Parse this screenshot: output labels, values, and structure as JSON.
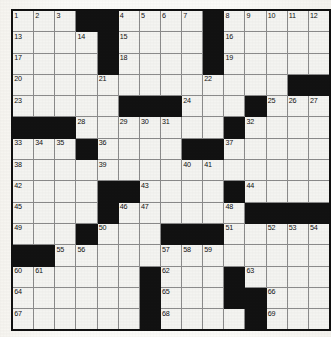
{
  "puzzle": {
    "type": "crossword-grid",
    "rows": 14,
    "cols": 15,
    "colors": {
      "block": "#121212",
      "cell": "#f4f4f1",
      "border": "#8b8b8b",
      "outer_border": "#111111",
      "number_text": "#101010",
      "page_background": "#fbfbf8"
    },
    "legend": {
      "W": "white answer cell",
      "B": "black blocked cell"
    },
    "layout": [
      [
        "W",
        "W",
        "W",
        "B",
        "B",
        "W",
        "W",
        "W",
        "W",
        "B",
        "W",
        "W",
        "W",
        "W",
        "W"
      ],
      [
        "W",
        "W",
        "W",
        "W",
        "B",
        "W",
        "W",
        "W",
        "W",
        "B",
        "W",
        "W",
        "W",
        "W",
        "W"
      ],
      [
        "W",
        "W",
        "W",
        "W",
        "B",
        "W",
        "W",
        "W",
        "W",
        "B",
        "W",
        "W",
        "W",
        "W",
        "W"
      ],
      [
        "W",
        "W",
        "W",
        "W",
        "W",
        "W",
        "W",
        "W",
        "W",
        "W",
        "W",
        "W",
        "W",
        "B",
        "B"
      ],
      [
        "W",
        "W",
        "W",
        "W",
        "W",
        "B",
        "B",
        "B",
        "W",
        "W",
        "W",
        "B",
        "W",
        "W",
        "W"
      ],
      [
        "B",
        "B",
        "B",
        "W",
        "W",
        "W",
        "W",
        "W",
        "W",
        "W",
        "B",
        "W",
        "W",
        "W",
        "W"
      ],
      [
        "W",
        "W",
        "W",
        "B",
        "W",
        "W",
        "W",
        "W",
        "B",
        "B",
        "W",
        "W",
        "W",
        "W",
        "W"
      ],
      [
        "W",
        "W",
        "W",
        "W",
        "W",
        "W",
        "W",
        "W",
        "W",
        "W",
        "W",
        "W",
        "W",
        "W",
        "W"
      ],
      [
        "W",
        "W",
        "W",
        "W",
        "B",
        "B",
        "W",
        "W",
        "W",
        "W",
        "B",
        "W",
        "W",
        "W",
        "W"
      ],
      [
        "W",
        "W",
        "W",
        "W",
        "B",
        "W",
        "W",
        "W",
        "W",
        "W",
        "W",
        "B",
        "B",
        "B",
        "B"
      ],
      [
        "W",
        "W",
        "W",
        "B",
        "W",
        "W",
        "W",
        "B",
        "B",
        "B",
        "W",
        "W",
        "W",
        "W",
        "W"
      ],
      [
        "B",
        "B",
        "W",
        "W",
        "W",
        "W",
        "W",
        "W",
        "W",
        "W",
        "W",
        "W",
        "W",
        "W",
        "W"
      ],
      [
        "W",
        "W",
        "W",
        "W",
        "W",
        "W",
        "B",
        "W",
        "W",
        "W",
        "B",
        "W",
        "W",
        "W",
        "W"
      ],
      [
        "W",
        "W",
        "W",
        "W",
        "W",
        "W",
        "B",
        "W",
        "W",
        "W",
        "B",
        "B",
        "W",
        "W",
        "W"
      ]
    ],
    "numbers": [
      [
        1,
        2,
        3,
        null,
        null,
        4,
        5,
        6,
        7,
        null,
        8,
        9,
        10,
        11,
        12
      ],
      [
        13,
        null,
        null,
        14,
        null,
        15,
        null,
        null,
        null,
        null,
        16,
        null,
        null,
        null,
        null
      ],
      [
        17,
        null,
        null,
        null,
        null,
        18,
        null,
        null,
        null,
        null,
        19,
        null,
        null,
        null,
        null
      ],
      [
        20,
        null,
        null,
        null,
        21,
        null,
        null,
        null,
        null,
        22,
        null,
        null,
        null,
        null,
        null
      ],
      [
        23,
        null,
        null,
        null,
        null,
        null,
        null,
        null,
        24,
        null,
        null,
        null,
        25,
        26,
        27
      ],
      [
        null,
        null,
        null,
        28,
        null,
        29,
        30,
        31,
        null,
        null,
        null,
        32,
        null,
        null,
        null
      ],
      [
        33,
        34,
        35,
        null,
        36,
        null,
        null,
        null,
        null,
        null,
        37,
        null,
        null,
        null,
        null
      ],
      [
        38,
        null,
        null,
        null,
        39,
        null,
        null,
        null,
        40,
        41,
        null,
        null,
        null,
        null,
        null
      ],
      [
        42,
        null,
        null,
        null,
        null,
        null,
        43,
        null,
        null,
        null,
        null,
        44,
        null,
        null,
        null
      ],
      [
        45,
        null,
        null,
        null,
        null,
        46,
        47,
        null,
        null,
        null,
        48,
        null,
        null,
        null,
        null
      ],
      [
        49,
        null,
        null,
        null,
        50,
        null,
        null,
        null,
        null,
        null,
        51,
        null,
        52,
        53,
        54
      ],
      [
        null,
        null,
        55,
        56,
        null,
        null,
        null,
        57,
        58,
        59,
        null,
        null,
        null,
        null,
        null
      ],
      [
        60,
        61,
        null,
        null,
        null,
        null,
        null,
        62,
        null,
        null,
        null,
        63,
        null,
        null,
        null
      ],
      [
        64,
        null,
        null,
        null,
        null,
        null,
        null,
        65,
        null,
        null,
        null,
        null,
        66,
        null,
        null
      ]
    ],
    "last_row_numbers": [
      67,
      null,
      null,
      null,
      null,
      null,
      null,
      68,
      null,
      null,
      null,
      null,
      69,
      null,
      null
    ]
  }
}
